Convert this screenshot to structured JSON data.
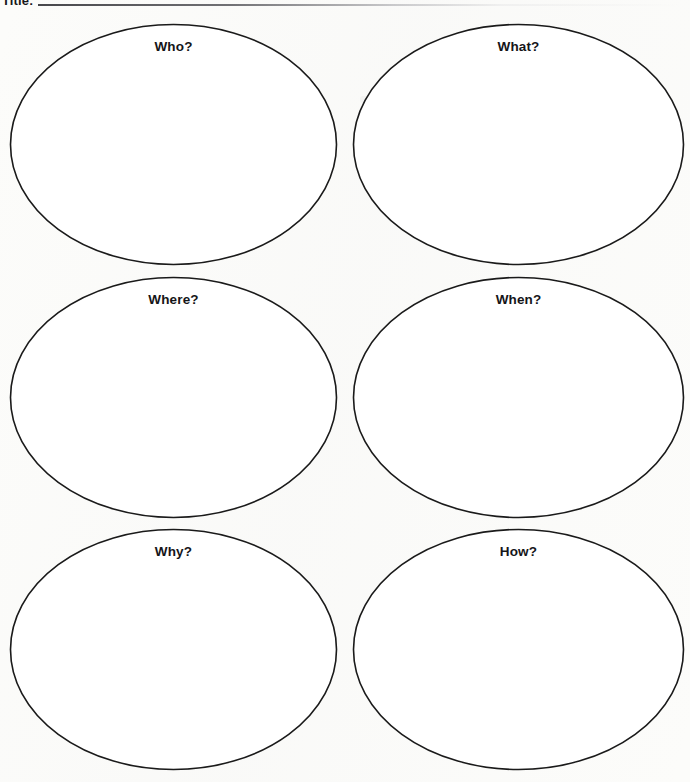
{
  "page": {
    "background_color": "#fcfcfa",
    "ink_color": "#1a1a1a",
    "label_color": "#151518"
  },
  "header": {
    "label": "Title:",
    "rule": "fill-in-blank-rule"
  },
  "worksheet": {
    "type": "5w1h-graphic-organizer",
    "columns": 2,
    "rows": 3,
    "bubbles": [
      {
        "id": "who",
        "label": "Who?",
        "row": 1,
        "column": "left"
      },
      {
        "id": "what",
        "label": "What?",
        "row": 1,
        "column": "right"
      },
      {
        "id": "where",
        "label": "Where?",
        "row": 2,
        "column": "left"
      },
      {
        "id": "when",
        "label": "When?",
        "row": 2,
        "column": "right"
      },
      {
        "id": "why",
        "label": "Why?",
        "row": 3,
        "column": "left"
      },
      {
        "id": "how",
        "label": "How?",
        "row": 3,
        "column": "right"
      }
    ]
  }
}
